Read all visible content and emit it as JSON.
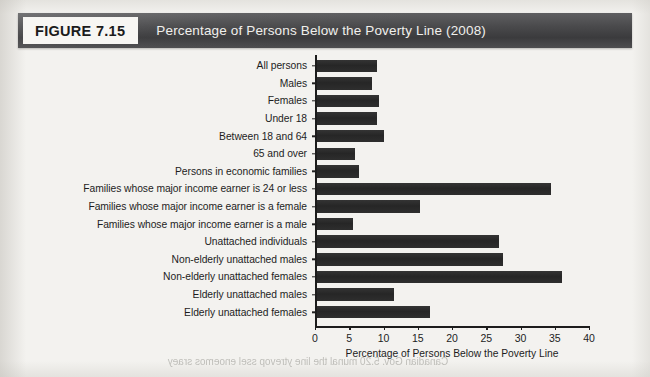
{
  "figure": {
    "tag": "FIGURE 7.15",
    "title": "Percentage of Persons Below the Poverty Line (2008)"
  },
  "page": {
    "bleed_text": "Canadian Gov. 5.20 munal the line ytrevop ssel enoemos sraey"
  },
  "colors": {
    "bar": "#2b2b2b",
    "banner": "#4a4a4c",
    "tag_background": "#f7f6f3",
    "page_background": "#f3f2ef",
    "axis": "#1c1c1c",
    "text": "#1d1d1d"
  },
  "chart_data": {
    "type": "bar",
    "orientation": "horizontal",
    "title": "Percentage of Persons Below the Poverty Line (2008)",
    "xlabel": "Percentage of Persons Below the Poverty Line",
    "ylabel": "",
    "xlim": [
      0,
      40
    ],
    "xticks": [
      0,
      5,
      10,
      15,
      20,
      25,
      30,
      35,
      40
    ],
    "grid": false,
    "legend": false,
    "categories": [
      "All persons",
      "Males",
      "Females",
      "Under 18",
      "Between 18 and 64",
      "65 and over",
      "Persons in economic families",
      "Families whose major income earner is 24 or less",
      "Families whose major income earner is a female",
      "Families whose major income earner is a male",
      "Unattached individuals",
      "Non-elderly unattached males",
      "Non-elderly unattached females",
      "Elderly unattached males",
      "Elderly unattached females"
    ],
    "values": [
      9.0,
      8.3,
      9.4,
      9.0,
      10.0,
      5.8,
      6.4,
      34.5,
      15.3,
      5.5,
      26.8,
      27.4,
      36.0,
      11.5,
      16.8
    ]
  }
}
